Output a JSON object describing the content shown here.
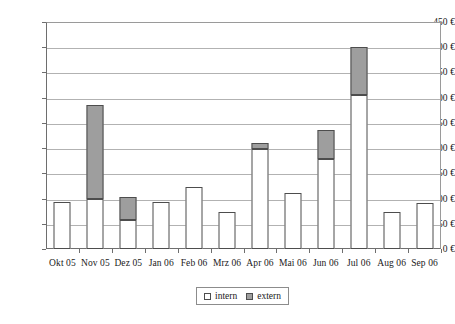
{
  "chart_data": {
    "type": "bar",
    "subtype": "stacked-column",
    "title": "",
    "xlabel": "",
    "ylabel": "",
    "ylim": [
      0,
      450
    ],
    "ytick_step": 50,
    "ytick_labels": [
      "0 €",
      "50 €",
      "100 €",
      "150 €",
      "200 €",
      "250 €",
      "300 €",
      "350 €",
      "400 €",
      "450 €"
    ],
    "ytick_values": [
      0,
      50,
      100,
      150,
      200,
      250,
      300,
      350,
      400,
      450
    ],
    "currency_symbol": "€",
    "grid": true,
    "grid_axis": "y",
    "legend_position": "bottom",
    "categories": [
      "Okt 05",
      "Nov 05",
      "Dez 05",
      "Jan 06",
      "Feb 06",
      "Mrz 06",
      "Apr 06",
      "Mai 06",
      "Jun 06",
      "Jul 06",
      "Aug 06",
      "Sep 06"
    ],
    "series": [
      {
        "name": "intern",
        "color": "#ffffff",
        "border_color": "#4d4d4d",
        "values": [
          93,
          100,
          57,
          93,
          123,
          74,
          198,
          111,
          178,
          305,
          74,
          92
        ]
      },
      {
        "name": "extern",
        "color": "#9e9e9e",
        "border_color": "#4d4d4d",
        "values": [
          0,
          185,
          46,
          0,
          0,
          0,
          13,
          0,
          57,
          95,
          0,
          0
        ]
      }
    ],
    "totals": [
      93,
      285,
      103,
      93,
      123,
      74,
      211,
      111,
      235,
      400,
      74,
      92
    ]
  },
  "legend": {
    "items": [
      {
        "label": "intern",
        "swatch": "white-square-icon"
      },
      {
        "label": "extern",
        "swatch": "gray-square-icon"
      }
    ]
  }
}
